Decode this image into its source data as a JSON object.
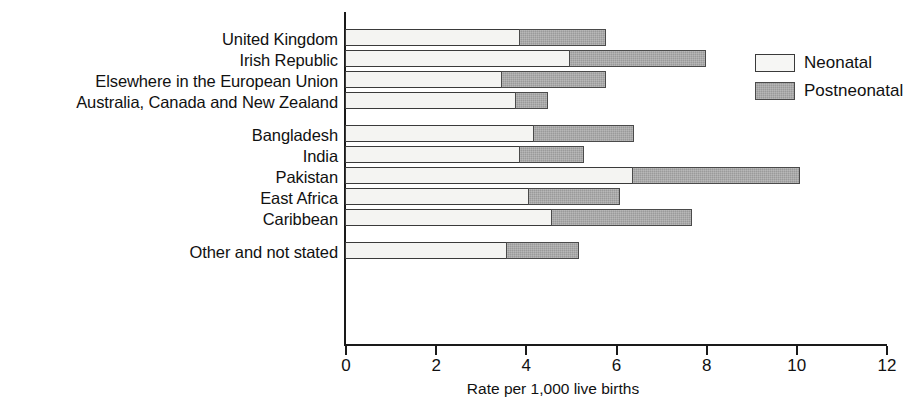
{
  "chart_data": {
    "type": "bar",
    "orientation": "horizontal",
    "stacked": true,
    "title": "",
    "xlabel": "Rate per 1,000 live births",
    "ylabel": "",
    "xlim": [
      0,
      12
    ],
    "xticks": [
      0,
      2,
      4,
      6,
      8,
      10,
      12
    ],
    "xtick_labels": [
      "0",
      "2",
      "4",
      "6",
      "8",
      "10",
      "12"
    ],
    "grid": false,
    "legend_position": "top-right",
    "categories": [
      "United Kingdom",
      "Irish Republic",
      "Elsewhere in the European Union",
      "Australia, Canada and New Zealand",
      "Bangladesh",
      "India",
      "Pakistan",
      "East Africa",
      "Caribbean",
      "Other and not stated"
    ],
    "group_breaks_after": [
      3,
      8
    ],
    "series": [
      {
        "name": "Neonatal",
        "color": "#f4f4f2",
        "values": [
          3.9,
          5.0,
          3.5,
          3.8,
          4.2,
          3.9,
          6.4,
          4.1,
          4.6,
          3.6
        ]
      },
      {
        "name": "Postneonatal",
        "color": "#9a9a9a",
        "values": [
          1.9,
          3.0,
          2.3,
          0.7,
          2.2,
          1.4,
          3.7,
          2.0,
          3.1,
          1.6
        ]
      }
    ],
    "totals": [
      5.8,
      8.0,
      5.8,
      4.5,
      6.4,
      5.3,
      10.1,
      6.1,
      7.7,
      5.2
    ]
  },
  "legend": {
    "items": [
      {
        "label": "Neonatal",
        "key": "neonatal"
      },
      {
        "label": "Postneonatal",
        "key": "postneonatal"
      }
    ]
  },
  "axis": {
    "x_title": "Rate per 1,000 live births",
    "tick_labels": [
      "0",
      "2",
      "4",
      "6",
      "8",
      "10",
      "12"
    ]
  }
}
